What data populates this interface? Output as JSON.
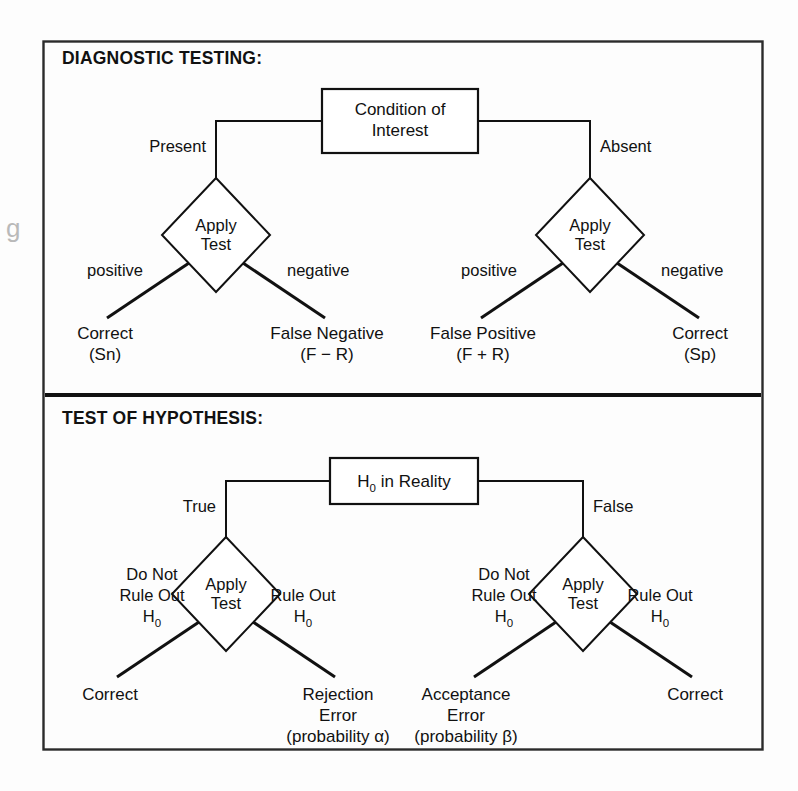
{
  "page": {
    "background": "#fdfdfd",
    "ink": "#111111",
    "frame_color": "#2b2b2b"
  },
  "sections": [
    {
      "id": "diagnostic",
      "heading": "DIAGNOSTIC TESTING:",
      "root": {
        "line1": "Condition  of",
        "line2": "Interest"
      },
      "left_branch_label": "Present",
      "right_branch_label": "Absent",
      "test_node": {
        "line1": "Apply",
        "line2": "Test"
      },
      "left_test": {
        "positive_label": "positive",
        "negative_label": "negative",
        "positive_outcome": {
          "line1": "Correct",
          "line2": "(Sn)"
        },
        "negative_outcome": {
          "line1": "False Negative",
          "line2": "(F − R)"
        }
      },
      "right_test": {
        "positive_label": "positive",
        "negative_label": "negative",
        "positive_outcome": {
          "line1": "False Positive",
          "line2": "(F + R)"
        },
        "negative_outcome": {
          "line1": "Correct",
          "line2": "(Sp)"
        }
      }
    },
    {
      "id": "hypothesis",
      "heading": "TEST OF HYPOTHESIS:",
      "root": {
        "prefix": "H",
        "subscript": "0",
        "suffix": " in Reality"
      },
      "left_branch_label": "True",
      "right_branch_label": "False",
      "test_node": {
        "line1": "Apply",
        "line2": "Test"
      },
      "left_test": {
        "do_not_rule_out": {
          "line1": "Do Not",
          "line2": "Rule Out",
          "line3_prefix": "H",
          "line3_sub": "0"
        },
        "rule_out": {
          "line1": "Rule Out",
          "line2_prefix": "H",
          "line2_sub": "0"
        },
        "left_outcome": {
          "line1": "Correct"
        },
        "right_outcome": {
          "line1": "Rejection",
          "line2": "Error",
          "line3": "(probability α)"
        }
      },
      "right_test": {
        "do_not_rule_out": {
          "line1": "Do Not",
          "line2": "Rule Out",
          "line3_prefix": "H",
          "line3_sub": "0"
        },
        "rule_out": {
          "line1": "Rule Out",
          "line2_prefix": "H",
          "line2_sub": "0"
        },
        "left_outcome": {
          "line1": "Acceptance",
          "line2": "Error",
          "line3": "(probability β)"
        },
        "right_outcome": {
          "line1": "Correct"
        }
      }
    }
  ],
  "artifacts": {
    "left_margin_glyph": "g"
  }
}
